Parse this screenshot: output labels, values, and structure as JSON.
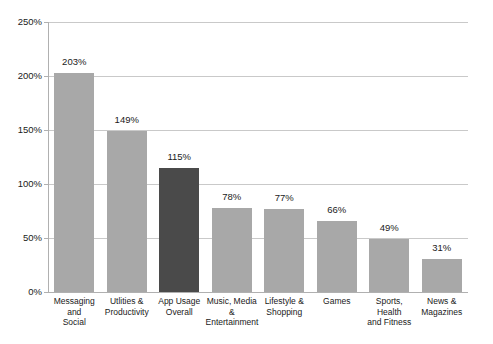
{
  "chart_data": {
    "type": "bar",
    "title": "",
    "subtitle": "",
    "xlabel": "",
    "ylabel": "",
    "ylim": [
      0,
      250
    ],
    "ytick_labels": [
      "0%",
      "50%",
      "100%",
      "150%",
      "200%",
      "250%"
    ],
    "ytick_values": [
      0,
      50,
      100,
      150,
      200,
      250
    ],
    "grid": true,
    "legend": "none",
    "value_suffix": "%",
    "categories": [
      "Messaging and Social",
      "Utlities & Productivity",
      "App Usage Overall",
      "Music, Media & Entertainment",
      "Lifestyle & Shopping",
      "Games",
      "Sports, Health and Fitness",
      "News & Magazines"
    ],
    "category_label_lines": [
      [
        "Messaging and",
        "Social"
      ],
      [
        "Utlities &",
        "Productivity"
      ],
      [
        "App Usage",
        "Overall"
      ],
      [
        "Music, Media",
        "&",
        "Entertainment"
      ],
      [
        "Lifestyle &",
        "Shopping"
      ],
      [
        "Games"
      ],
      [
        "Sports, Health",
        "and Fitness"
      ],
      [
        "News &",
        "Magazines"
      ]
    ],
    "values": [
      203,
      149,
      115,
      78,
      77,
      66,
      49,
      31
    ],
    "value_labels": [
      "203%",
      "149%",
      "115%",
      "78%",
      "77%",
      "66%",
      "49%",
      "31%"
    ],
    "highlight_index": 2,
    "colors": {
      "bar": "#a8a8a8",
      "bar_highlight": "#4a4a4a",
      "gridline": "#c9c9c9",
      "axis": "#b0b0b0",
      "text": "#1a1a1a",
      "background": "#ffffff"
    }
  }
}
